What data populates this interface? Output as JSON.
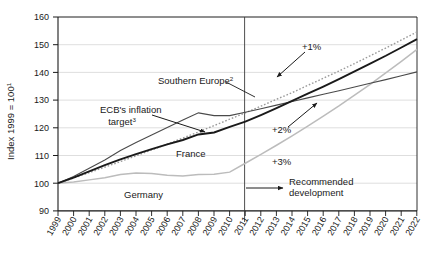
{
  "chart_data": {
    "type": "line",
    "title": "",
    "xlabel": "",
    "ylabel": "Index 1999 = 100",
    "ylabel_superscript": "1",
    "ylim": [
      90,
      160
    ],
    "yticks": [
      90,
      100,
      110,
      120,
      130,
      140,
      150,
      160
    ],
    "ytick_labels": [
      "90",
      "100",
      "110",
      "120",
      "130",
      "140",
      "150",
      "160"
    ],
    "xlim": [
      1999,
      2022
    ],
    "x": [
      1999,
      2000,
      2001,
      2002,
      2003,
      2004,
      2005,
      2006,
      2007,
      2008,
      2009,
      2010,
      2011,
      2012,
      2013,
      2014,
      2015,
      2016,
      2017,
      2018,
      2019,
      2020,
      2021,
      2022
    ],
    "xtick_labels": [
      "1999",
      "2000",
      "2001",
      "2002",
      "2003",
      "2004",
      "2005",
      "2006",
      "2007",
      "2008",
      "2009",
      "2010",
      "2011",
      "2012",
      "2013",
      "2014",
      "2015",
      "2016",
      "2017",
      "2018",
      "2019",
      "2020",
      "2021",
      "2022"
    ],
    "grid": true,
    "legend": "inline-annotations",
    "divider_year": 2011.55,
    "divider_note": "vertical line separating historical data from recommended development",
    "series": [
      {
        "name": "Southern Europe",
        "superscript": "2",
        "color": "#4a4a4a",
        "style": "solid-thin",
        "values": [
          100.0,
          102.4,
          105.4,
          108.4,
          111.8,
          114.7,
          117.4,
          120.1,
          122.8,
          125.4,
          124.4,
          124.4,
          125.6,
          126.9,
          128.2,
          129.5,
          130.8,
          132.1,
          133.4,
          134.7,
          136.1,
          137.4,
          138.8,
          140.2
        ],
        "projection_rate_percent": 1.0,
        "projection_label": "+1%"
      },
      {
        "name": "France",
        "superscript": "",
        "color": "#1a1a1a",
        "style": "solid-thick",
        "values": [
          100.0,
          102.0,
          104.3,
          106.5,
          108.6,
          110.5,
          112.3,
          114.0,
          115.6,
          117.6,
          118.3,
          120.3,
          122.2,
          124.6,
          127.1,
          129.7,
          132.3,
          134.9,
          137.6,
          140.4,
          143.2,
          146.0,
          149.0,
          152.0
        ],
        "projection_rate_percent": 2.0,
        "projection_label": "+2%"
      },
      {
        "name": "Germany",
        "superscript": "",
        "color": "#bcbcbc",
        "style": "solid-light",
        "values": [
          100.0,
          100.4,
          101.2,
          102.0,
          103.1,
          103.7,
          103.5,
          102.9,
          102.6,
          103.1,
          103.2,
          104.0,
          107.2,
          110.4,
          113.7,
          117.1,
          120.6,
          124.2,
          127.9,
          131.8,
          135.7,
          139.8,
          144.0,
          148.3
        ],
        "projection_rate_percent": 3.0,
        "projection_label": "+3%"
      },
      {
        "name": "ECB's inflation target",
        "superscript": "3",
        "color": "#9a9a9a",
        "style": "dotted",
        "values": [
          100.0,
          101.9,
          103.8,
          105.8,
          107.8,
          109.9,
          112.0,
          114.1,
          116.3,
          118.5,
          120.8,
          123.1,
          125.4,
          127.8,
          130.3,
          132.7,
          135.3,
          137.9,
          140.5,
          143.2,
          146.0,
          148.8,
          151.7,
          154.6
        ]
      }
    ],
    "annotations": [
      {
        "text": "Southern Europe",
        "superscript": "2",
        "type": "series-label"
      },
      {
        "text": "France",
        "superscript": "",
        "type": "series-label"
      },
      {
        "text": "Germany",
        "superscript": "",
        "type": "series-label"
      },
      {
        "text": "ECB's inflation",
        "superscript": "",
        "type": "series-label-line1"
      },
      {
        "text": "target",
        "superscript": "3",
        "type": "series-label-line2"
      },
      {
        "text": "+1%",
        "superscript": "",
        "type": "rate-callout"
      },
      {
        "text": "+2%",
        "superscript": "",
        "type": "rate-callout"
      },
      {
        "text": "+3%",
        "superscript": "",
        "type": "rate-callout"
      },
      {
        "text": "Recommended",
        "superscript": "",
        "type": "note-line1"
      },
      {
        "text": "development",
        "superscript": "",
        "type": "note-line2"
      }
    ]
  },
  "labels": {
    "y_axis_title": "Index 1999 = 100",
    "y_axis_title_sup": "1",
    "southern_europe": "Southern Europe",
    "southern_europe_sup": "2",
    "france": "France",
    "germany": "Germany",
    "ecb_line1": "ECB's inflation",
    "ecb_line2": "target",
    "ecb_sup": "3",
    "rate1": "+1%",
    "rate2": "+2%",
    "rate3": "+3%",
    "note_line1": "Recommended",
    "note_line2": "development"
  },
  "yticks": {
    "t0": "160",
    "t1": "150",
    "t2": "140",
    "t3": "130",
    "t4": "120",
    "t5": "110",
    "t6": "100",
    "t7": "90"
  },
  "xticks": {
    "x0": "1999",
    "x1": "2000",
    "x2": "2001",
    "x3": "2002",
    "x4": "2003",
    "x5": "2004",
    "x6": "2005",
    "x7": "2006",
    "x8": "2007",
    "x9": "2008",
    "x10": "2009",
    "x11": "2010",
    "x12": "2011",
    "x13": "2012",
    "x14": "2013",
    "x15": "2014",
    "x16": "2015",
    "x17": "2016",
    "x18": "2017",
    "x19": "2018",
    "x20": "2019",
    "x21": "2020",
    "x22": "2021",
    "x23": "2022"
  },
  "colors": {
    "southern_europe": "#4a4a4a",
    "france": "#1a1a1a",
    "germany": "#bcbcbc",
    "ecb_target": "#9a9a9a",
    "grid": "#d6d6d6",
    "axis": "#1a1a1a"
  }
}
